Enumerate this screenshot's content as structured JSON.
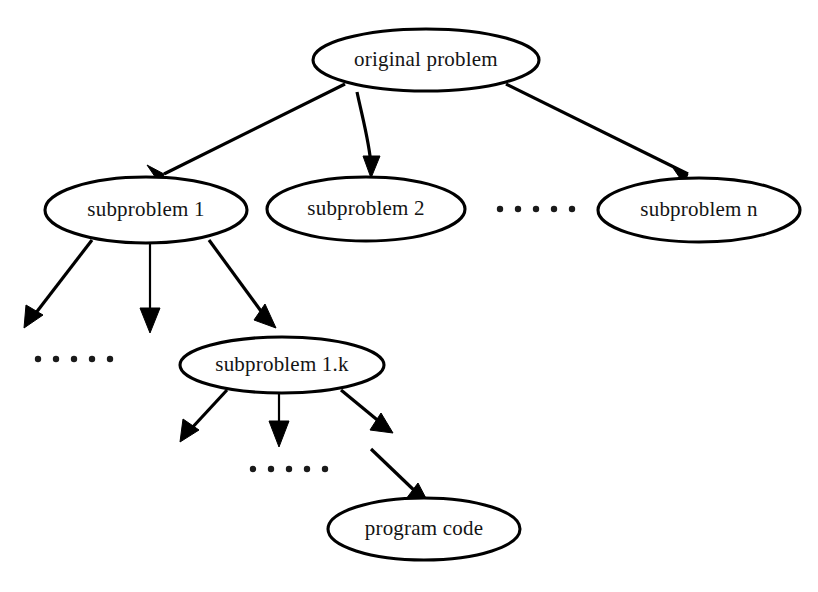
{
  "diagram": {
    "background_color": "#ffffff",
    "stroke_color": "#000000",
    "text_color": "#141414",
    "nodes": [
      {
        "id": "original-problem",
        "label": "original problem",
        "cx": 426,
        "cy": 60,
        "rx": 113,
        "ry": 31
      },
      {
        "id": "subproblem-1",
        "label": "subproblem 1",
        "cx": 146,
        "cy": 210,
        "rx": 101,
        "ry": 33
      },
      {
        "id": "subproblem-2",
        "label": "subproblem 2",
        "cx": 366,
        "cy": 209,
        "rx": 99,
        "ry": 32
      },
      {
        "id": "subproblem-n",
        "label": "subproblem n",
        "cx": 699,
        "cy": 210,
        "rx": 101,
        "ry": 32
      },
      {
        "id": "subproblem-1k",
        "label": "subproblem 1.k",
        "cx": 282,
        "cy": 365,
        "rx": 102,
        "ry": 28
      },
      {
        "id": "program-code",
        "label": "program code",
        "cx": 424,
        "cy": 529,
        "rx": 96,
        "ry": 31
      }
    ],
    "ellipses_groups": [
      {
        "id": "ellipsis-row-top",
        "dots": 5,
        "x_start": 500,
        "y": 209,
        "spacing": 17,
        "radius": 3
      },
      {
        "id": "ellipsis-row-middle-left",
        "dots": 5,
        "x_start": 30,
        "y": 359,
        "spacing": 17,
        "radius": 3
      },
      {
        "id": "ellipsis-row-bottom",
        "dots": 5,
        "x_start": 248,
        "y": 468,
        "spacing": 17,
        "radius": 3
      }
    ],
    "edges": [
      {
        "id": "edge-original-to-sub1",
        "from": "original-problem",
        "to": "subproblem-1",
        "x1": 345,
        "y1": 84,
        "x2": 168,
        "y2": 172
      },
      {
        "id": "edge-original-to-sub2",
        "from": "original-problem",
        "to": "subproblem-2",
        "x1": 357,
        "y1": 101,
        "x2": 371,
        "y2": 174
      },
      {
        "id": "edge-original-to-subn",
        "from": "original-problem",
        "to": "subproblem-n",
        "x1": 506,
        "y1": 84,
        "x2": 684,
        "y2": 172
      },
      {
        "id": "edge-sub1-to-left",
        "from": "subproblem-1",
        "to": "ellipsis-row-middle-left",
        "x1": 90,
        "y1": 240,
        "x2": 26,
        "y2": 322
      },
      {
        "id": "edge-sub1-to-mid",
        "from": "subproblem-1",
        "to": "ellipsis-row-middle-left",
        "x1": 150,
        "y1": 243,
        "x2": 150,
        "y2": 326
      },
      {
        "id": "edge-sub1-to-sub1k",
        "from": "subproblem-1",
        "to": "subproblem-1k",
        "x1": 211,
        "y1": 240,
        "x2": 272,
        "y2": 324
      },
      {
        "id": "edge-sub1k-to-left",
        "from": "subproblem-1k",
        "to": "ellipsis-row-bottom",
        "x1": 225,
        "y1": 392,
        "x2": 184,
        "y2": 443
      },
      {
        "id": "edge-sub1k-to-mid",
        "from": "subproblem-1k",
        "to": "ellipsis-row-bottom",
        "x1": 279,
        "y1": 394,
        "x2": 279,
        "y2": 445
      },
      {
        "id": "edge-sub1k-to-right",
        "from": "subproblem-1k",
        "to": "ellipsis-row-bottom",
        "x1": 343,
        "y1": 392,
        "x2": 386,
        "y2": 435
      },
      {
        "id": "edge-to-program-code",
        "from": "ellipsis-row-bottom",
        "to": "program-code",
        "x1": 372,
        "y1": 450,
        "x2": 426,
        "y2": 502
      }
    ],
    "caption": ""
  }
}
